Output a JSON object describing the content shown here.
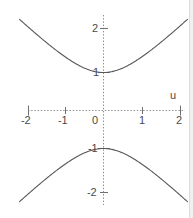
{
  "figure": {
    "width": 193,
    "height": 218,
    "background": "#ffffff",
    "axis_color": "#8a8a8a",
    "curve_color": "#585858",
    "label_color": "#4a4a4a"
  },
  "axes": {
    "x_name": "u",
    "y_name": "",
    "x_tick_labels": [
      "-2",
      "-1",
      "0",
      "1",
      "2"
    ],
    "y_tick_labels": [
      "2",
      "1",
      "-1",
      "-2"
    ]
  },
  "chart_data": {
    "type": "line",
    "title": "",
    "subtitle": "",
    "xlabel": "u",
    "ylabel": "",
    "xlim": [
      -2,
      2
    ],
    "ylim": [
      -2.6,
      2.6
    ],
    "xticks": [
      -2,
      -1,
      0,
      1,
      2
    ],
    "yticks": [
      -2,
      -1,
      1,
      2
    ],
    "xticklabels": [
      "-2",
      "-1",
      "0",
      "1",
      "2"
    ],
    "yticklabels": [
      "-2",
      "-1",
      "1",
      "2"
    ],
    "grid": false,
    "legend": null,
    "legend_position": "none",
    "annotations": [
      {
        "text": "u",
        "x": 1.82,
        "y": 0.42,
        "note": "horizontal axis name at right end above axis"
      }
    ],
    "equation": "y = ±sqrt(1 + u^2)",
    "series": [
      {
        "name": "upper branch",
        "style": "solid",
        "color": "#585858",
        "x": [
          -2.0,
          -1.8,
          -1.6,
          -1.4,
          -1.2,
          -1.0,
          -0.8,
          -0.6,
          -0.4,
          -0.2,
          0.0,
          0.2,
          0.4,
          0.6,
          0.8,
          1.0,
          1.2,
          1.4,
          1.6,
          1.8,
          2.0
        ],
        "y": [
          2.236,
          2.059,
          1.887,
          1.72,
          1.562,
          1.414,
          1.281,
          1.166,
          1.077,
          1.02,
          1.0,
          1.02,
          1.077,
          1.166,
          1.281,
          1.414,
          1.562,
          1.72,
          1.887,
          2.059,
          2.236
        ]
      },
      {
        "name": "lower branch",
        "style": "solid",
        "color": "#585858",
        "x": [
          -2.0,
          -1.8,
          -1.6,
          -1.4,
          -1.2,
          -1.0,
          -0.8,
          -0.6,
          -0.4,
          -0.2,
          0.0,
          0.2,
          0.4,
          0.6,
          0.8,
          1.0,
          1.2,
          1.4,
          1.6,
          1.8,
          2.0
        ],
        "y": [
          -2.236,
          -2.059,
          -1.887,
          -1.72,
          -1.562,
          -1.414,
          -1.281,
          -1.166,
          -1.077,
          -1.02,
          -1.0,
          -1.02,
          -1.077,
          -1.166,
          -1.281,
          -1.414,
          -1.562,
          -1.72,
          -1.887,
          -2.059,
          -2.236
        ]
      }
    ]
  }
}
